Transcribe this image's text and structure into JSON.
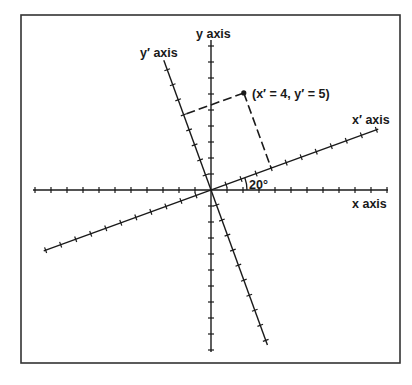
{
  "figure": {
    "labels": {
      "x_axis": "x axis",
      "y_axis": "y axis",
      "x_prime_axis": "x′ axis",
      "y_prime_axis": "y′ axis",
      "point": "(x′ = 4, y′ = 5)",
      "angle": "20°"
    },
    "rotation_angle_deg": 20,
    "point": {
      "x_prime": 4,
      "y_prime": 5
    },
    "colors": {
      "line": "#1a1a1a",
      "frame": "#333333",
      "background": "#ffffff"
    }
  },
  "geometry": {
    "frame": {
      "x": 21,
      "y": 15,
      "w": 379,
      "h": 348
    },
    "origin": {
      "x": 211,
      "y": 190
    },
    "unit_px": 16,
    "x_axis": {
      "neg_len": 178,
      "pos_len": 177
    },
    "y_axis": {
      "neg_len": 162,
      "pos_len": 150
    },
    "x_prime_axis": {
      "neg_len": 178,
      "pos_len": 178
    },
    "y_prime_axis": {
      "neg_len": 165,
      "pos_len": 138
    },
    "arc_radius": 36
  }
}
